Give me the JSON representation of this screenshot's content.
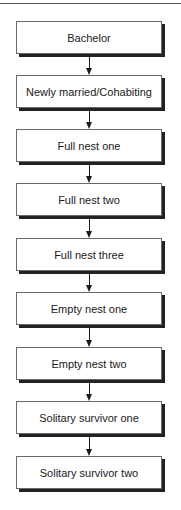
{
  "diagram": {
    "type": "vertical-flowchart",
    "stages": [
      {
        "label": "Bachelor"
      },
      {
        "label": "Newly married/Cohabiting"
      },
      {
        "label": "Full nest one"
      },
      {
        "label": "Full nest two"
      },
      {
        "label": "Full nest three"
      },
      {
        "label": "Empty nest one"
      },
      {
        "label": "Empty nest two"
      },
      {
        "label": "Solitary survivor one"
      },
      {
        "label": "Solitary survivor two"
      }
    ],
    "connectors": [
      {
        "from": 0,
        "to": 1
      },
      {
        "from": 1,
        "to": 2
      },
      {
        "from": 2,
        "to": 3
      },
      {
        "from": 3,
        "to": 4
      },
      {
        "from": 4,
        "to": 5
      },
      {
        "from": 5,
        "to": 6
      },
      {
        "from": 6,
        "to": 7
      },
      {
        "from": 7,
        "to": 8
      }
    ],
    "colors": {
      "box_border": "#6a6a6a",
      "box_shadow": "#222222",
      "text": "#1a1a1a",
      "arrow": "#1a1a1a",
      "background": "#ffffff"
    }
  }
}
